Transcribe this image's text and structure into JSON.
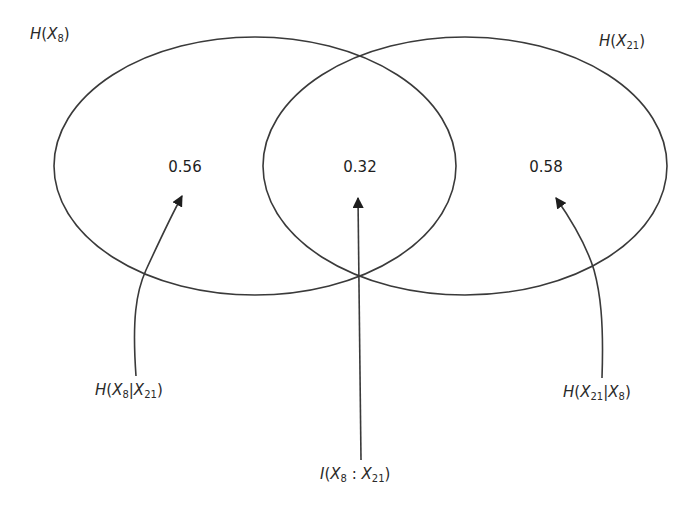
{
  "diagram": {
    "type": "venn",
    "title": "",
    "sets": [
      {
        "id": "X8",
        "label": "H(X_8)",
        "label_parts": {
          "fn": "H",
          "var": "X",
          "sub": "8"
        },
        "exclusive_value": "0.56",
        "exclusive_label": "H(X_8|X_21)",
        "exclusive_label_parts": {
          "fn": "H",
          "var1": "X",
          "sub1": "8",
          "sep": "|",
          "var2": "X",
          "sub2": "21"
        }
      },
      {
        "id": "X21",
        "label": "H(X_21)",
        "label_parts": {
          "fn": "H",
          "var": "X",
          "sub": "21"
        },
        "exclusive_value": "0.58",
        "exclusive_label": "H(X_21|X_8)",
        "exclusive_label_parts": {
          "fn": "H",
          "var1": "X",
          "sub1": "21",
          "sep": "|",
          "var2": "X",
          "sub2": "8"
        }
      }
    ],
    "intersection": {
      "value": "0.32",
      "label": "I(X_8 : X_21)",
      "label_parts": {
        "fn": "I",
        "var1": "X",
        "sub1": "8",
        "sep": " : ",
        "var2": "X",
        "sub2": "21"
      }
    },
    "colors": {
      "stroke": "#3a3a3a",
      "text": "#1e1e1e",
      "background": "#ffffff"
    }
  }
}
